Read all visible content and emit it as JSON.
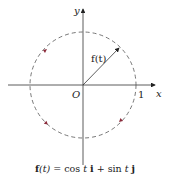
{
  "diagram": {
    "axis_labels": {
      "x": "x",
      "y": "y",
      "origin": "O",
      "tick_x": "1"
    },
    "vector_label": "f(t)",
    "caption": {
      "func": "f",
      "arg": "(t)",
      "eq": " = cos ",
      "t1": "t",
      "i": "i",
      "plus": " + sin ",
      "t2": "t",
      "j": "j"
    },
    "circle": {
      "center": [
        83,
        85
      ],
      "radius": 53,
      "style": "dashed",
      "color": "#8b2a3a"
    },
    "arrow_color": "#8b2a3a",
    "direction": "counterclockwise"
  }
}
